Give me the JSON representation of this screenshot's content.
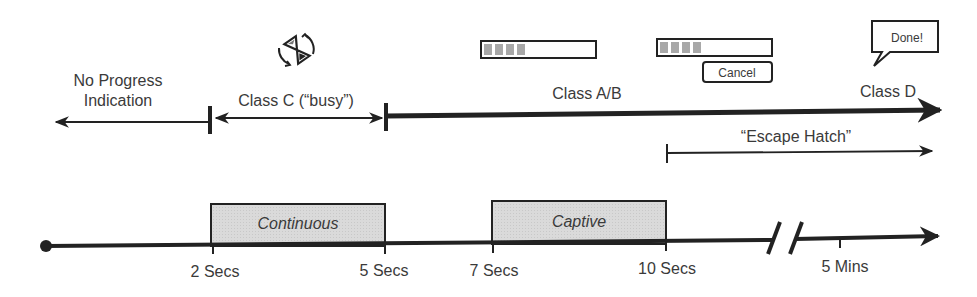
{
  "top_timeline": {
    "zones": [
      {
        "id": "no-progress",
        "label_line1": "No Progress",
        "label_line2": "Indication"
      },
      {
        "id": "class-c",
        "label": "Class C (“busy”)"
      },
      {
        "id": "class-ab",
        "label": "Class A/B"
      },
      {
        "id": "class-d",
        "label": "Class D"
      }
    ],
    "escape_hatch": {
      "label": "“Escape Hatch”"
    }
  },
  "illustrations": {
    "busy_icon": "rotating-hourglass-icon",
    "progress_bar_a": {
      "filled_segments": 4
    },
    "progress_bar_b": {
      "filled_segments": 4
    },
    "cancel_button": {
      "label": "Cancel"
    },
    "done_bubble": {
      "label": "Done!"
    }
  },
  "bottom_timeline": {
    "boxes": [
      {
        "id": "continuous",
        "label": "Continuous"
      },
      {
        "id": "captive",
        "label": "Captive"
      }
    ],
    "ticks": [
      {
        "label": "2 Secs"
      },
      {
        "label": "5 Secs"
      },
      {
        "label": "7 Secs"
      },
      {
        "label": "10 Secs"
      },
      {
        "label": "5 Mins"
      }
    ],
    "axis_break": "//"
  },
  "colors": {
    "line": "#222222",
    "text": "#3a3a3a",
    "box_fill": "#d9d9d9",
    "progress_fill": "#a8a8a8"
  }
}
